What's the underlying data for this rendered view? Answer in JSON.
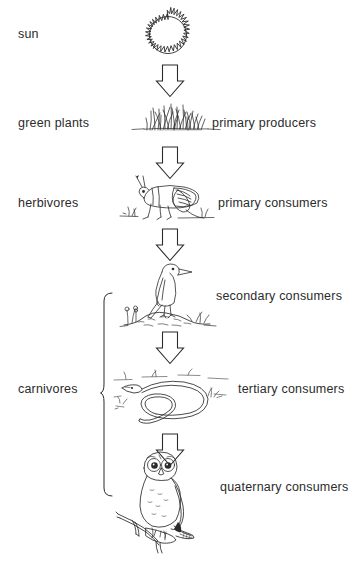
{
  "diagram": {
    "background_color": "#ffffff",
    "ink_color": "#2b2b2b",
    "levels": [
      {
        "id": "sun",
        "left_label": "sun",
        "right_label": "",
        "illustration": "sun-icon"
      },
      {
        "id": "green-plants",
        "left_label": "green plants",
        "right_label": "primary producers",
        "illustration": "grass-icon"
      },
      {
        "id": "herbivores",
        "left_label": "herbivores",
        "right_label": "primary consumers",
        "illustration": "grasshopper-icon"
      },
      {
        "id": "secondary",
        "left_label": "",
        "right_label": "secondary consumers",
        "illustration": "bird-icon"
      },
      {
        "id": "tertiary",
        "left_label": "",
        "right_label": "tertiary consumers",
        "illustration": "snake-icon"
      },
      {
        "id": "quaternary",
        "left_label": "",
        "right_label": "quaternary consumers",
        "illustration": "owl-icon"
      }
    ],
    "group_label": "carnivores",
    "arrow_count": 5,
    "arrow_direction": "down"
  }
}
